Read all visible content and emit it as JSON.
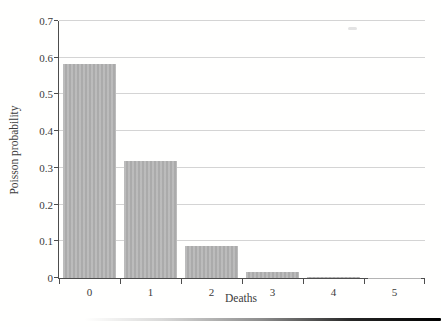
{
  "chart_data": {
    "type": "bar",
    "title": "",
    "categories": [
      "0",
      "1",
      "2",
      "3",
      "4",
      "5"
    ],
    "values": [
      0.583,
      0.32,
      0.087,
      0.016,
      0.003,
      0.0005
    ],
    "xlabel": "Deaths",
    "ylabel": "Poisson probability",
    "ylim": [
      0,
      0.7
    ],
    "ytick_step": 0.1,
    "ytick_labels": [
      "0",
      "0.1",
      "0.2",
      "0.3",
      "0.4",
      "0.5",
      "0.6",
      "0.7"
    ],
    "grid": true,
    "legend": "none",
    "bar_width_fraction": 0.87,
    "colors": {
      "bar_fill": "#b4b4b4",
      "grid_line": "#d4d4d4",
      "axis_line": "#4d4d4d",
      "text": "#3b3b3b",
      "background": "#fffffe"
    }
  }
}
